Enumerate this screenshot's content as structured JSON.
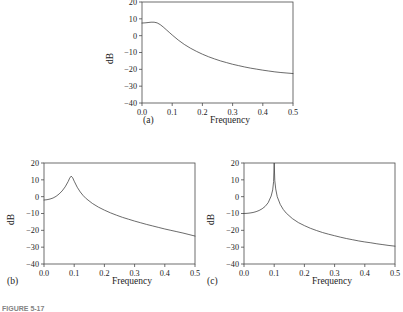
{
  "figure": {
    "caption": "FIGURE 5-17",
    "panel_letters": [
      "(a)",
      "(b)",
      "(c)"
    ],
    "axis_titles": {
      "x": "Frequency",
      "y": "dB"
    },
    "line_color": "#3a3a3a",
    "frame_color": "#4a4a4a",
    "background": "#ffffff"
  },
  "chart_data": [
    {
      "type": "line",
      "panel": "(a)",
      "title": "",
      "xlabel": "Frequency",
      "ylabel": "dB",
      "xlim": [
        0.0,
        0.5
      ],
      "ylim": [
        -40,
        20
      ],
      "xticks": [
        "0.0",
        "0.1",
        "0.2",
        "0.3",
        "0.4",
        "0.5"
      ],
      "xtick_values": [
        0.0,
        0.1,
        0.2,
        0.3,
        0.4,
        0.5
      ],
      "yticks": [
        "20",
        "10",
        "0",
        "−10",
        "−20",
        "−30",
        "−40"
      ],
      "ytick_values": [
        20,
        10,
        0,
        -10,
        -20,
        -30,
        -40
      ],
      "grid": false,
      "legend": "none",
      "peak": {
        "x": 0.04,
        "y": 8.0
      },
      "x": [
        0.0,
        0.01,
        0.02,
        0.03,
        0.04,
        0.05,
        0.06,
        0.07,
        0.08,
        0.09,
        0.1,
        0.12,
        0.14,
        0.16,
        0.18,
        0.2,
        0.22,
        0.24,
        0.26,
        0.28,
        0.3,
        0.32,
        0.34,
        0.36,
        0.38,
        0.4,
        0.42,
        0.44,
        0.46,
        0.48,
        0.5
      ],
      "y": [
        7.5,
        7.6,
        7.8,
        8.0,
        8.0,
        7.6,
        6.6,
        5.2,
        3.6,
        2.0,
        0.4,
        -2.6,
        -5.2,
        -7.4,
        -9.3,
        -11.0,
        -12.5,
        -13.8,
        -15.0,
        -16.0,
        -17.0,
        -17.8,
        -18.6,
        -19.3,
        -19.9,
        -20.5,
        -21.0,
        -21.5,
        -21.9,
        -22.2,
        -22.5
      ]
    },
    {
      "type": "line",
      "panel": "(b)",
      "title": "",
      "xlabel": "Frequency",
      "ylabel": "dB",
      "xlim": [
        0.0,
        0.5
      ],
      "ylim": [
        -40,
        20
      ],
      "xticks": [
        "0.0",
        "0.1",
        "0.2",
        "0.3",
        "0.4",
        "0.5"
      ],
      "xtick_values": [
        0.0,
        0.1,
        0.2,
        0.3,
        0.4,
        0.5
      ],
      "yticks": [
        "20",
        "10",
        "0",
        "−10",
        "−20",
        "−30",
        "−40"
      ],
      "ytick_values": [
        20,
        10,
        0,
        -10,
        -20,
        -30,
        -40
      ],
      "grid": false,
      "legend": "none",
      "peak": {
        "x": 0.09,
        "y": 12.2
      },
      "x": [
        0.0,
        0.01,
        0.02,
        0.03,
        0.04,
        0.05,
        0.06,
        0.07,
        0.08,
        0.085,
        0.09,
        0.095,
        0.1,
        0.11,
        0.12,
        0.13,
        0.14,
        0.16,
        0.18,
        0.2,
        0.22,
        0.24,
        0.26,
        0.28,
        0.3,
        0.32,
        0.34,
        0.36,
        0.38,
        0.4,
        0.42,
        0.44,
        0.46,
        0.48,
        0.5
      ],
      "y": [
        -2.0,
        -1.8,
        -1.4,
        -0.8,
        0.2,
        1.6,
        3.4,
        5.8,
        9.0,
        11.0,
        12.2,
        11.2,
        9.2,
        5.6,
        2.8,
        0.6,
        -1.2,
        -4.0,
        -6.2,
        -8.0,
        -9.6,
        -11.0,
        -12.3,
        -13.4,
        -14.5,
        -15.5,
        -16.5,
        -17.4,
        -18.3,
        -19.2,
        -20.0,
        -20.8,
        -21.6,
        -22.5,
        -23.4
      ]
    },
    {
      "type": "line",
      "panel": "(c)",
      "title": "",
      "xlabel": "Frequency",
      "ylabel": "dB",
      "xlim": [
        0.0,
        0.5
      ],
      "ylim": [
        -40,
        20
      ],
      "xticks": [
        "0.0",
        "0.1",
        "0.2",
        "0.3",
        "0.4",
        "0.5"
      ],
      "xtick_values": [
        0.0,
        0.1,
        0.2,
        0.3,
        0.4,
        0.5
      ],
      "yticks": [
        "20",
        "10",
        "0",
        "−10",
        "−20",
        "−30",
        "−40"
      ],
      "ytick_values": [
        20,
        10,
        0,
        -10,
        -20,
        -30,
        -40
      ],
      "grid": false,
      "legend": "none",
      "peak": {
        "x": 0.1,
        "y": 20.0
      },
      "x": [
        0.0,
        0.01,
        0.02,
        0.03,
        0.04,
        0.05,
        0.06,
        0.07,
        0.08,
        0.09,
        0.095,
        0.098,
        0.1,
        0.102,
        0.105,
        0.11,
        0.12,
        0.13,
        0.14,
        0.16,
        0.18,
        0.2,
        0.22,
        0.24,
        0.26,
        0.28,
        0.3,
        0.32,
        0.34,
        0.36,
        0.38,
        0.4,
        0.42,
        0.44,
        0.46,
        0.48,
        0.5
      ],
      "y": [
        -10.0,
        -9.9,
        -9.7,
        -9.4,
        -8.9,
        -8.2,
        -7.2,
        -5.8,
        -3.6,
        0.4,
        4.0,
        9.0,
        20.0,
        9.5,
        4.6,
        0.0,
        -4.6,
        -7.6,
        -9.8,
        -13.0,
        -15.4,
        -17.2,
        -18.8,
        -20.1,
        -21.3,
        -22.3,
        -23.2,
        -24.1,
        -24.9,
        -25.6,
        -26.3,
        -26.9,
        -27.4,
        -28.0,
        -28.5,
        -29.0,
        -29.4
      ]
    }
  ]
}
